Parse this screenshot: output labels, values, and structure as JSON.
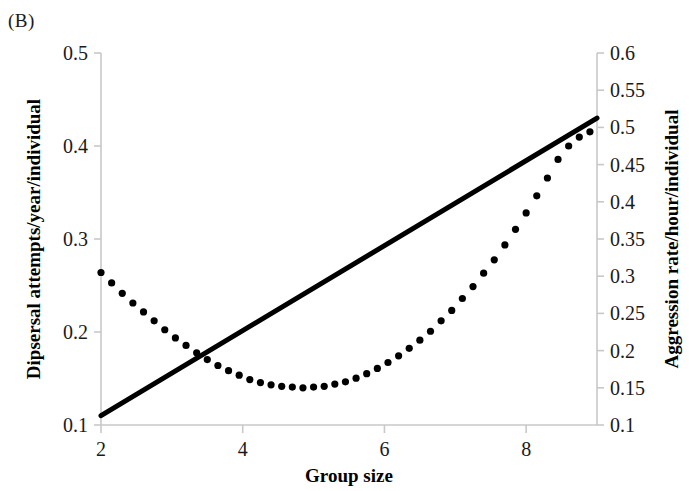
{
  "panel": {
    "label": "(B)"
  },
  "chart_data": {
    "type": "line",
    "title": "",
    "panel_label": "(B)",
    "xlabel": "Group size",
    "ylabel": "Dipsersal attempts/year/individual",
    "y2label": "Aggression rate/hour/individual",
    "xlim": [
      2,
      9
    ],
    "ylim": [
      0.1,
      0.5
    ],
    "y2lim": [
      0.1,
      0.6
    ],
    "xticks": [
      2,
      4,
      6,
      8
    ],
    "xticklabels": [
      "2",
      "4",
      "6",
      "8"
    ],
    "yticks": [
      0.1,
      0.2,
      0.3,
      0.4,
      0.5
    ],
    "yticklabels": [
      "0.1",
      "0.2",
      "0.3",
      "0.4",
      "0.5"
    ],
    "y2ticks": [
      0.1,
      0.15,
      0.2,
      0.25,
      0.3,
      0.35,
      0.4,
      0.45,
      0.5,
      0.55,
      0.6
    ],
    "y2ticklabels": [
      "0.1",
      "0.15",
      "0.2",
      "0.25",
      "0.3",
      "0.35",
      "0.4",
      "0.45",
      "0.5",
      "0.55",
      "0.6"
    ],
    "grid": false,
    "legend": "none",
    "series": [
      {
        "name": "Dipsersal attempts/year/individual",
        "axis": "left",
        "style": "solid",
        "color": "#000000",
        "linewidth": 5,
        "x": [
          2,
          9
        ],
        "values": [
          0.11,
          0.43
        ]
      },
      {
        "name": "Aggression rate/hour/individual",
        "axis": "right",
        "style": "dotted",
        "color": "#000000",
        "marker": "circle",
        "marker_size": 6,
        "x": [
          2.0,
          2.15,
          2.3,
          2.45,
          2.6,
          2.75,
          2.9,
          3.05,
          3.2,
          3.35,
          3.5,
          3.65,
          3.8,
          3.95,
          4.1,
          4.25,
          4.4,
          4.55,
          4.7,
          4.85,
          5.0,
          5.15,
          5.3,
          5.45,
          5.6,
          5.75,
          5.9,
          6.05,
          6.2,
          6.35,
          6.5,
          6.65,
          6.8,
          6.95,
          7.1,
          7.25,
          7.4,
          7.55,
          7.7,
          7.85,
          8.0,
          8.15,
          8.3,
          8.45,
          8.6,
          8.75,
          8.9
        ],
        "values": [
          0.305,
          0.291,
          0.277,
          0.264,
          0.252,
          0.24,
          0.228,
          0.217,
          0.207,
          0.197,
          0.188,
          0.18,
          0.173,
          0.167,
          0.161,
          0.157,
          0.154,
          0.152,
          0.151,
          0.15,
          0.151,
          0.152,
          0.155,
          0.158,
          0.163,
          0.169,
          0.176,
          0.184,
          0.193,
          0.203,
          0.214,
          0.226,
          0.24,
          0.254,
          0.27,
          0.286,
          0.304,
          0.322,
          0.342,
          0.363,
          0.385,
          0.408,
          0.432,
          0.457,
          0.475,
          0.487,
          0.494
        ]
      }
    ]
  }
}
